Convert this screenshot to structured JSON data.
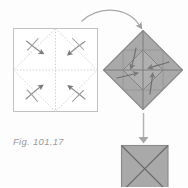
{
  "figure": {
    "caption": "Fig. 101.17",
    "caption_prefix": "Fig.",
    "caption_number": "101.17",
    "type": "origami-folding-instruction",
    "background_color": "#fdfdfd"
  },
  "colors": {
    "paper_fill": "#a9a9a9",
    "paper_fill_light": "#b6b6b6",
    "paper_fill_dark": "#9d9d9d",
    "outline": "#8a8a8a",
    "crease_dotted": "#c9c9c9",
    "square_border": "#bdbdbd",
    "arrow_gray": "#9e9e9e",
    "arrow_dark": "#6f6f6f",
    "caption_color": "#9a9a9a"
  },
  "steps": [
    {
      "id": "step-1",
      "name": "unfolded-square",
      "label": "Unfolded square with crease lines",
      "shape": "square",
      "filled": false,
      "x": 13,
      "y": 28,
      "width": 85,
      "height": 84,
      "creases": [
        "diagonal-diamond",
        "horizontal-midline",
        "vertical-midline",
        "corner-diagonals"
      ],
      "fold_arrows": 4,
      "fold_direction": "corners-to-center"
    },
    {
      "id": "step-2",
      "name": "folded-diamond",
      "label": "Diamond with corners folded to center",
      "shape": "diamond",
      "filled": true,
      "center_x": 143,
      "center_y": 70,
      "radius_x": 40,
      "radius_y": 40,
      "inner_square": true,
      "fold_arrows": 4,
      "fold_direction": "corners-to-center"
    },
    {
      "id": "step-3",
      "name": "final-square",
      "label": "Resulting square with X creases",
      "shape": "square",
      "filled": true,
      "x": 121,
      "y": 145,
      "width": 47,
      "height": 47,
      "creases": [
        "diagonal-x"
      ],
      "fold_arrows": 0
    }
  ],
  "arrows": [
    {
      "id": "arrow-1",
      "name": "arc-arrow-square-to-diamond",
      "style": "curved-arc",
      "from_step": "step-1",
      "to_step": "step-2",
      "direction": "left-to-right"
    },
    {
      "id": "arrow-2",
      "name": "straight-arrow-diamond-to-square",
      "style": "straight-vertical",
      "from_step": "step-2",
      "to_step": "step-3",
      "direction": "top-to-bottom"
    }
  ]
}
